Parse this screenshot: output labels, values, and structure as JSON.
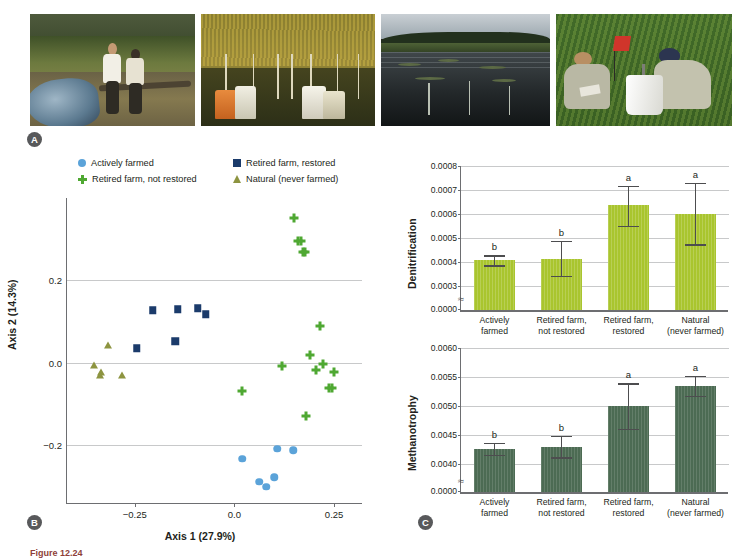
{
  "panels": {
    "a": {
      "label": "A",
      "photos": [
        {
          "name": "photo-researchers-wetland",
          "alt": "Two researchers standing in a wetland with a pond"
        },
        {
          "name": "photo-gas-chambers-marsh",
          "alt": "Gas flux chambers placed in golden marsh grass"
        },
        {
          "name": "photo-flooded-wetland",
          "alt": "Dark flooded wetland landscape with treeline"
        },
        {
          "name": "photo-sampling-bucket",
          "alt": "Two researchers sampling with a white bucket chamber"
        }
      ]
    },
    "b": {
      "label": "B"
    },
    "c": {
      "label": "C"
    }
  },
  "caption": "Figure 12.24",
  "chart_data": [
    {
      "type": "scatter",
      "title": "",
      "xlabel": "Axis 1 (27.9%)",
      "ylabel": "Axis 2 (14.3%)",
      "xlim": [
        -0.42,
        0.32
      ],
      "ylim": [
        -0.34,
        0.4
      ],
      "xticks": [
        -0.25,
        0.0,
        0.25
      ],
      "xticklabels": [
        "−0.25",
        "0.0",
        "0.25"
      ],
      "yticks": [
        0.2,
        0.0,
        -0.2
      ],
      "yticklabels": [
        "0.2",
        "0.0",
        "−0.2"
      ],
      "grid": true,
      "legend_position": "above-plot",
      "series": [
        {
          "name": "Actively farmed",
          "marker": "circle",
          "color": "#5ba3d9",
          "points": [
            [
              0.02,
              -0.233
            ],
            [
              0.062,
              -0.288
            ],
            [
              0.08,
              -0.3
            ],
            [
              0.1,
              -0.277
            ],
            [
              0.108,
              -0.208
            ],
            [
              0.148,
              -0.212
            ]
          ]
        },
        {
          "name": "Retired farm, not restored",
          "marker": "cross",
          "color": "#4fa832",
          "points": [
            [
              0.02,
              -0.068
            ],
            [
              0.12,
              -0.007
            ],
            [
              0.15,
              0.352
            ],
            [
              0.16,
              0.296
            ],
            [
              0.168,
              0.296
            ],
            [
              0.172,
              0.268
            ],
            [
              0.178,
              0.268
            ],
            [
              0.18,
              -0.128
            ],
            [
              0.19,
              0.018
            ],
            [
              0.205,
              -0.018
            ],
            [
              0.215,
              0.09
            ],
            [
              0.222,
              -0.003
            ],
            [
              0.238,
              -0.06
            ],
            [
              0.245,
              -0.06
            ],
            [
              0.25,
              -0.022
            ]
          ]
        },
        {
          "name": "Retired farm, restored",
          "marker": "square",
          "color": "#1b3b6b",
          "points": [
            [
              -0.245,
              0.035
            ],
            [
              -0.205,
              0.128
            ],
            [
              -0.148,
              0.053
            ],
            [
              -0.142,
              0.13
            ],
            [
              -0.092,
              0.132
            ],
            [
              -0.072,
              0.118
            ]
          ]
        },
        {
          "name": "Natural (never farmed)",
          "marker": "triangle",
          "color": "#8d9440",
          "points": [
            [
              -0.352,
              -0.005
            ],
            [
              -0.338,
              -0.03
            ],
            [
              -0.335,
              -0.022
            ],
            [
              -0.318,
              0.044
            ],
            [
              -0.282,
              -0.03
            ]
          ]
        }
      ]
    },
    {
      "type": "bar",
      "title": "",
      "ylabel": "Denitrification",
      "xlabel": "",
      "categories": [
        "Actively farmed",
        "Retired farm, not restored",
        "Retired farm, restored",
        "Natural (never farmed)"
      ],
      "category_lines": [
        [
          "Actively",
          "farmed"
        ],
        [
          "Retired farm,",
          "not restored"
        ],
        [
          "Retired farm,",
          "restored"
        ],
        [
          "Natural",
          "(never farmed)"
        ]
      ],
      "values": [
        0.000407,
        0.000412,
        0.000636,
        0.000602
      ],
      "err_low": [
        0.000387,
        0.000343,
        0.000551,
        0.000474
      ],
      "err_high": [
        0.000428,
        0.000489,
        0.000718,
        0.00073
      ],
      "sig_letters": [
        "b",
        "b",
        "a",
        "a"
      ],
      "yticks": [
        0.0,
        0.0003,
        0.0004,
        0.0005,
        0.0006,
        0.0007,
        0.0008
      ],
      "yticklabels": [
        "0.0000",
        "0.0003",
        "0.0004",
        "0.0005",
        "0.0006",
        "0.0007",
        "0.0008"
      ],
      "ylim": [
        0.00028,
        0.0008
      ],
      "axis_break": true,
      "grid": true,
      "color": "#a9c52e"
    },
    {
      "type": "bar",
      "title": "",
      "ylabel": "Methanotrophy",
      "xlabel": "",
      "categories": [
        "Actively farmed",
        "Retired farm, not restored",
        "Retired farm, restored",
        "Natural (never farmed)"
      ],
      "category_lines": [
        [
          "Actively",
          "farmed"
        ],
        [
          "Retired farm,",
          "not restored"
        ],
        [
          "Retired farm,",
          "restored"
        ],
        [
          "Natural",
          "(never farmed)"
        ]
      ],
      "values": [
        0.004268,
        0.004303,
        0.005008,
        0.005352
      ],
      "err_low": [
        0.004165,
        0.004118,
        0.00461,
        0.005172
      ],
      "err_high": [
        0.004372,
        0.004488,
        0.005392,
        0.00552
      ],
      "sig_letters": [
        "b",
        "b",
        "a",
        "a"
      ],
      "yticks": [
        0.0,
        0.004,
        0.0045,
        0.005,
        0.0055,
        0.006
      ],
      "yticklabels": [
        "0.0000",
        "0.0040",
        "0.0045",
        "0.0050",
        "0.0055",
        "0.0060"
      ],
      "ylim": [
        0.00385,
        0.006
      ],
      "axis_break": true,
      "grid": true,
      "color": "#4c6b53"
    }
  ],
  "legend": {
    "items": [
      {
        "label": "Actively farmed",
        "marker": "circle"
      },
      {
        "label": "Retired farm, restored",
        "marker": "square"
      },
      {
        "label": "Retired farm, not restored",
        "marker": "cross"
      },
      {
        "label": "Natural (never farmed)",
        "marker": "triangle"
      }
    ]
  }
}
